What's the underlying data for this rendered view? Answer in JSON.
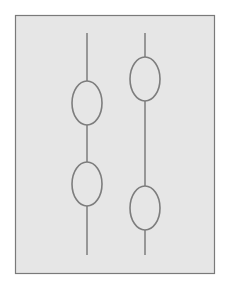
{
  "diagram": {
    "panel": {
      "x": 15,
      "y": 15,
      "width": 199,
      "height": 258,
      "fill": "#e6e6e6",
      "stroke": "#7a7a7a"
    },
    "stroke_color": "#7d7d7d",
    "strings": [
      {
        "id": "left",
        "x": 87,
        "y1": 33,
        "y2": 255,
        "beads": [
          {
            "cx": 87,
            "cy": 103,
            "rx": 15,
            "ry": 22
          },
          {
            "cx": 87,
            "cy": 184,
            "rx": 15,
            "ry": 22
          }
        ]
      },
      {
        "id": "right",
        "x": 145,
        "y1": 33,
        "y2": 255,
        "beads": [
          {
            "cx": 145,
            "cy": 79,
            "rx": 15,
            "ry": 22
          },
          {
            "cx": 145,
            "cy": 208,
            "rx": 15,
            "ry": 22
          }
        ]
      }
    ]
  }
}
